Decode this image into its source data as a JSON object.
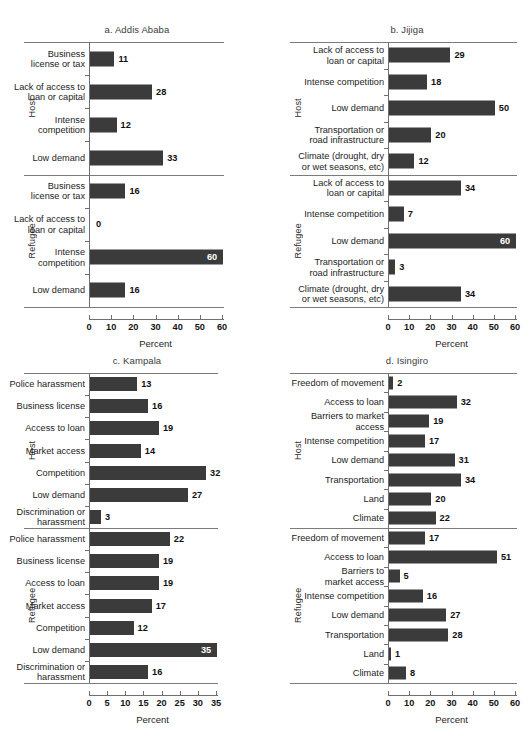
{
  "figure": {
    "background": "#ffffff",
    "bar_color": "#3b3b3b",
    "axis_color": "#6f6f6f",
    "group_labels": {
      "host": "Host",
      "refugee": "Refugee"
    },
    "x_axis_title": "Percent"
  },
  "chart_data": [
    {
      "type": "bar",
      "orientation": "horizontal",
      "title": "a. Addis Ababa",
      "xlabel": "Percent",
      "ylabel": "",
      "xlim": [
        0,
        60
      ],
      "xticks": [
        0,
        10,
        20,
        30,
        40,
        50,
        60
      ],
      "grid": false,
      "legend": "none",
      "groups": [
        {
          "name": "Host",
          "categories": [
            "Business\nlicense or tax",
            "Lack of access to\nloan or capital",
            "Intense\ncompetition",
            "Low demand"
          ],
          "values": [
            11,
            28,
            12,
            33
          ]
        },
        {
          "name": "Refugee",
          "categories": [
            "Business\nlicense or tax",
            "Lack of access to\nloan or capital",
            "Intense\ncompetition",
            "Low demand"
          ],
          "values": [
            16,
            0,
            60,
            16
          ]
        }
      ]
    },
    {
      "type": "bar",
      "orientation": "horizontal",
      "title": "b. Jijiga",
      "xlabel": "Percent",
      "ylabel": "",
      "xlim": [
        0,
        60
      ],
      "xticks": [
        0,
        10,
        20,
        30,
        40,
        50,
        60
      ],
      "grid": false,
      "legend": "none",
      "groups": [
        {
          "name": "Host",
          "categories": [
            "Lack of access to\nloan or capital",
            "Intense competition",
            "Low demand",
            "Transportation or\nroad infrastructure",
            "Climate (drought, dry\nor wet seasons, etc)"
          ],
          "values": [
            29,
            18,
            50,
            20,
            12
          ]
        },
        {
          "name": "Refugee",
          "categories": [
            "Lack of access to\nloan or capital",
            "Intense competition",
            "Low demand",
            "Transportation or\nroad infrastructure",
            "Climate (drought, dry\nor wet seasons, etc)"
          ],
          "values": [
            34,
            7,
            60,
            3,
            34
          ]
        }
      ]
    },
    {
      "type": "bar",
      "orientation": "horizontal",
      "title": "c. Kampala",
      "xlabel": "Percent",
      "ylabel": "",
      "xlim": [
        0,
        35
      ],
      "xticks": [
        0,
        5,
        10,
        15,
        20,
        25,
        30,
        35
      ],
      "grid": false,
      "legend": "none",
      "groups": [
        {
          "name": "Host",
          "categories": [
            "Police harassment",
            "Business license",
            "Access to loan",
            "Market access",
            "Competition",
            "Low demand",
            "Discrimination or\nharassment"
          ],
          "values": [
            13,
            16,
            19,
            14,
            32,
            27,
            3
          ]
        },
        {
          "name": "Refugee",
          "categories": [
            "Police harassment",
            "Business license",
            "Access to loan",
            "Market access",
            "Competition",
            "Low demand",
            "Discrimination or\nharassment"
          ],
          "values": [
            22,
            19,
            19,
            17,
            12,
            35,
            16
          ]
        }
      ]
    },
    {
      "type": "bar",
      "orientation": "horizontal",
      "title": "d. Isingiro",
      "xlabel": "Percent",
      "ylabel": "",
      "xlim": [
        0,
        60
      ],
      "xticks": [
        0,
        10,
        20,
        30,
        40,
        50,
        60
      ],
      "grid": false,
      "legend": "none",
      "groups": [
        {
          "name": "Host",
          "categories": [
            "Freedom of movement",
            "Access to loan",
            "Barriers to market\naccess",
            "Intense competition",
            "Low demand",
            "Transportation",
            "Land",
            "Climate"
          ],
          "values": [
            2,
            32,
            19,
            17,
            31,
            34,
            20,
            22
          ]
        },
        {
          "name": "Refugee",
          "categories": [
            "Freedom of movement",
            "Access to loan",
            "Barriers to\nmarket access",
            "Intense competition",
            "Low demand",
            "Transportation",
            "Land",
            "Climate"
          ],
          "values": [
            17,
            51,
            5,
            16,
            27,
            28,
            1,
            8
          ]
        }
      ]
    }
  ]
}
